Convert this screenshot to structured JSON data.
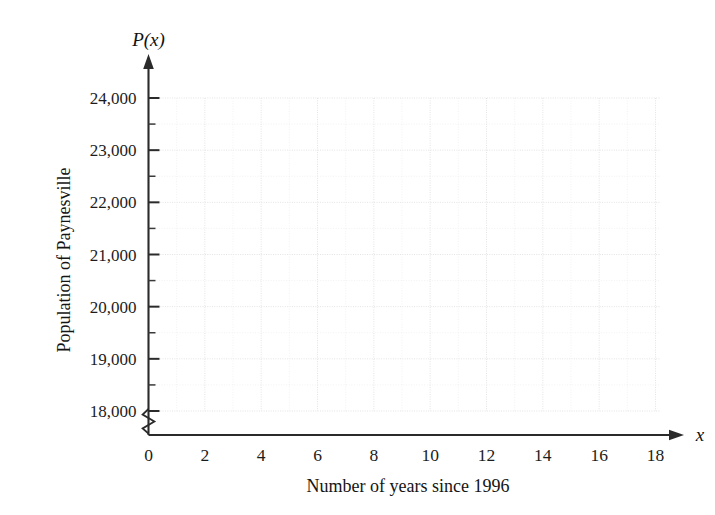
{
  "chart_data": {
    "type": "line",
    "title": "",
    "subtitle": "",
    "xlabel": "Number of years since 1996",
    "ylabel": "Population of Paynesville",
    "x_axis_variable": "x",
    "y_axis_variable": "P(x)",
    "xlim": [
      0,
      18
    ],
    "ylim": [
      17750,
      24250
    ],
    "y_axis_break": true,
    "y_axis_break_note": "zigzag break below 18,000",
    "grid": true,
    "legend": null,
    "series": [],
    "values": [],
    "x": [],
    "categories": [],
    "annotations": [],
    "xticks": [
      {
        "value": 0,
        "label": "0"
      },
      {
        "value": 1,
        "label": ""
      },
      {
        "value": 2,
        "label": "2"
      },
      {
        "value": 3,
        "label": ""
      },
      {
        "value": 4,
        "label": "4"
      },
      {
        "value": 5,
        "label": ""
      },
      {
        "value": 6,
        "label": "6"
      },
      {
        "value": 7,
        "label": ""
      },
      {
        "value": 8,
        "label": "8"
      },
      {
        "value": 9,
        "label": ""
      },
      {
        "value": 10,
        "label": "10"
      },
      {
        "value": 11,
        "label": ""
      },
      {
        "value": 12,
        "label": "12"
      },
      {
        "value": 13,
        "label": ""
      },
      {
        "value": 14,
        "label": "14"
      },
      {
        "value": 15,
        "label": ""
      },
      {
        "value": 16,
        "label": "16"
      },
      {
        "value": 17,
        "label": ""
      },
      {
        "value": 18,
        "label": "18"
      }
    ],
    "yticks": [
      {
        "value": 18000,
        "label": "18,000",
        "major": true
      },
      {
        "value": 18500,
        "label": "",
        "major": false
      },
      {
        "value": 19000,
        "label": "19,000",
        "major": true
      },
      {
        "value": 19500,
        "label": "",
        "major": false
      },
      {
        "value": 20000,
        "label": "20,000",
        "major": true
      },
      {
        "value": 20500,
        "label": "",
        "major": false
      },
      {
        "value": 21000,
        "label": "21,000",
        "major": true
      },
      {
        "value": 21500,
        "label": "",
        "major": false
      },
      {
        "value": 22000,
        "label": "22,000",
        "major": true
      },
      {
        "value": 22500,
        "label": "",
        "major": false
      },
      {
        "value": 23000,
        "label": "23,000",
        "major": true
      },
      {
        "value": 23500,
        "label": "",
        "major": false
      },
      {
        "value": 24000,
        "label": "24,000",
        "major": true
      }
    ],
    "colors": {
      "background": "#ffffff",
      "axis": "#2b2b2b",
      "text": "#1a1a1a",
      "grid_major": "#e3e3e6",
      "grid_minor": "#f0f0f2"
    }
  }
}
